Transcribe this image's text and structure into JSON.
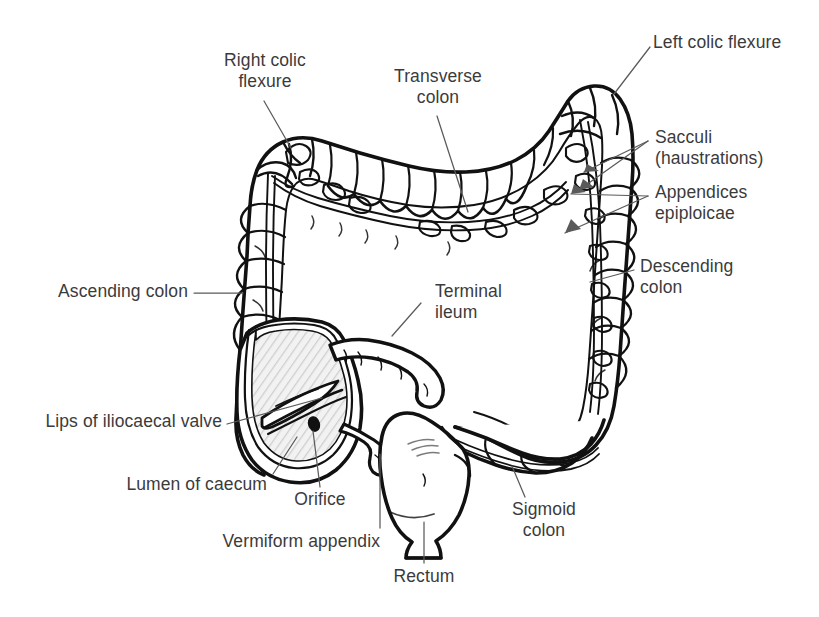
{
  "figure": {
    "background_color": "#ffffff",
    "ink_color": "#111111",
    "text_color": "#3b3b3b",
    "lumen_fill_color": "#e8e8e8"
  },
  "labels": {
    "right_colic_flexure": "Right colic\nflexure",
    "transverse_colon": "Transverse\ncolon",
    "left_colic_flexure": "Left colic flexure",
    "sacculi": "Sacculi\n(haustrations)",
    "appendices_epiploicae": "Appendices\nepiploicae",
    "descending_colon": "Descending\ncolon",
    "ascending_colon": "Ascending colon",
    "terminal_ileum": "Terminal\nileum",
    "lips_of_iliocaecal_valve": "Lips of iliocaecal valve",
    "lumen_of_caecum": "Lumen of caecum",
    "orifice": "Orifice",
    "vermiform_appendix": "Vermiform appendix",
    "sigmoid_colon": "Sigmoid\ncolon",
    "rectum": "Rectum"
  }
}
